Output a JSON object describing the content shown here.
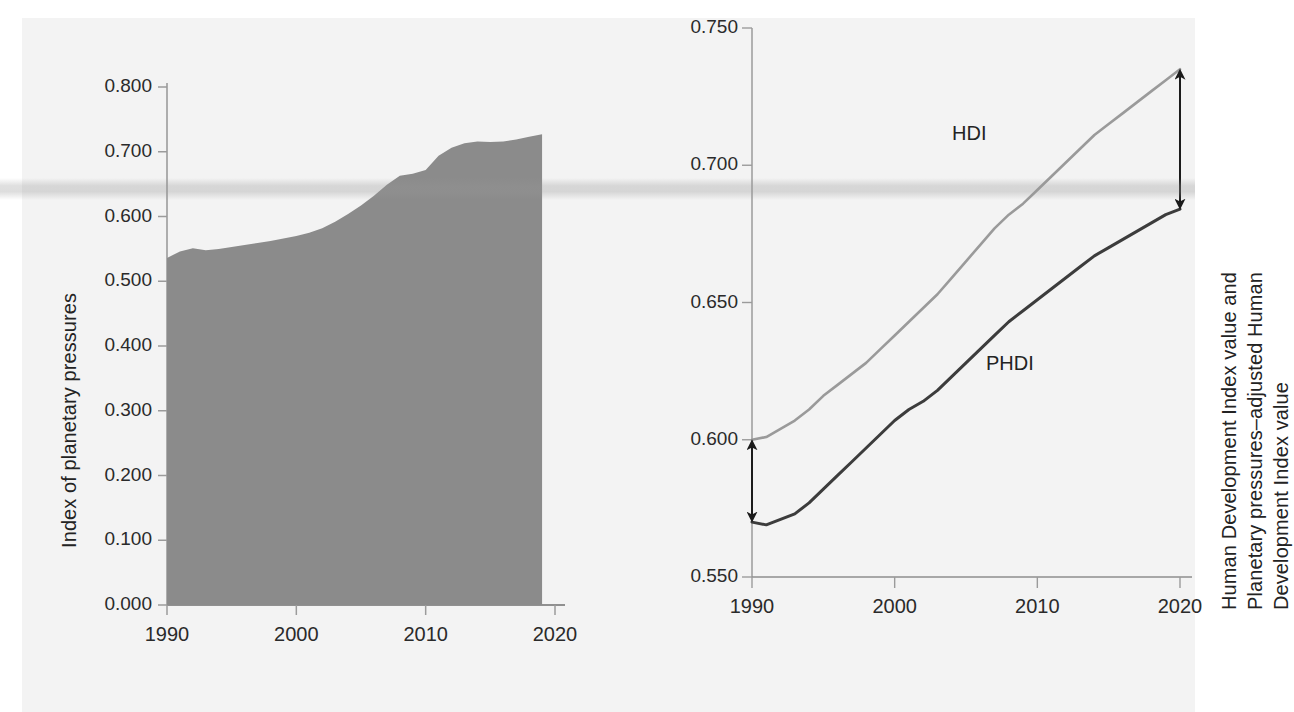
{
  "figure": {
    "background_color": "#f3f3f3",
    "page_color": "#ffffff"
  },
  "chart_data": [
    {
      "id": "planetary-pressures",
      "type": "area",
      "title": "",
      "xlabel": "",
      "ylabel": "Index of planetary pressures",
      "xlim": [
        1990,
        2020
      ],
      "ylim": [
        0.0,
        0.8
      ],
      "grid": false,
      "legend": "none",
      "xticks": [
        "1990",
        "2000",
        "2010",
        "2020"
      ],
      "xtick_values": [
        1990,
        2000,
        2010,
        2020
      ],
      "yticks": [
        "0.000",
        "0.100",
        "0.200",
        "0.300",
        "0.400",
        "0.500",
        "0.600",
        "0.700",
        "0.800"
      ],
      "ytick_values": [
        0.0,
        0.1,
        0.2,
        0.3,
        0.4,
        0.5,
        0.6,
        0.7,
        0.8
      ],
      "area_color": "#8b8b8b",
      "series": [
        {
          "name": "Index of planetary pressures",
          "x": [
            1990,
            1991,
            1992,
            1993,
            1994,
            1995,
            1996,
            1997,
            1998,
            1999,
            2000,
            2001,
            2002,
            2003,
            2004,
            2005,
            2006,
            2007,
            2008,
            2009,
            2010,
            2011,
            2012,
            2013,
            2014,
            2015,
            2016,
            2017,
            2018,
            2019
          ],
          "values": [
            0.536,
            0.546,
            0.551,
            0.548,
            0.55,
            0.553,
            0.556,
            0.559,
            0.562,
            0.566,
            0.57,
            0.575,
            0.582,
            0.592,
            0.604,
            0.617,
            0.632,
            0.649,
            0.663,
            0.666,
            0.672,
            0.694,
            0.706,
            0.713,
            0.716,
            0.715,
            0.716,
            0.719,
            0.723,
            0.727
          ]
        }
      ]
    },
    {
      "id": "hdi-phdi",
      "type": "line",
      "title": "",
      "xlabel": "",
      "ylabel": "Human Development Index value and\nPlanetary pressures–adjusted Human\nDevelopment Index value",
      "xlim": [
        1990,
        2020
      ],
      "ylim": [
        0.55,
        0.75
      ],
      "grid": false,
      "legend": "inline-labels",
      "xticks": [
        "1990",
        "2000",
        "2010",
        "2020"
      ],
      "xtick_values": [
        1990,
        2000,
        2010,
        2020
      ],
      "yticks": [
        "0.550",
        "0.600",
        "0.650",
        "0.700",
        "0.750"
      ],
      "ytick_values": [
        0.55,
        0.6,
        0.65,
        0.7,
        0.75
      ],
      "annotations": [
        {
          "name": "gap-arrow-1990",
          "year": 1990,
          "from": 0.6,
          "to": 0.57
        },
        {
          "name": "gap-arrow-2020",
          "year": 2020,
          "from": 0.735,
          "to": 0.684
        }
      ],
      "series": [
        {
          "name": "HDI",
          "label": "HDI",
          "color": "#9a9a9a",
          "x": [
            1990,
            1991,
            1992,
            1993,
            1994,
            1995,
            1996,
            1997,
            1998,
            1999,
            2000,
            2001,
            2002,
            2003,
            2004,
            2005,
            2006,
            2007,
            2008,
            2009,
            2010,
            2011,
            2012,
            2013,
            2014,
            2015,
            2016,
            2017,
            2018,
            2019,
            2020
          ],
          "values": [
            0.6,
            0.601,
            0.604,
            0.607,
            0.611,
            0.616,
            0.62,
            0.624,
            0.628,
            0.633,
            0.638,
            0.643,
            0.648,
            0.653,
            0.659,
            0.665,
            0.671,
            0.677,
            0.682,
            0.686,
            0.691,
            0.696,
            0.701,
            0.706,
            0.711,
            0.715,
            0.719,
            0.723,
            0.727,
            0.731,
            0.735
          ]
        },
        {
          "name": "PHDI",
          "label": "PHDI",
          "color": "#3c3c3c",
          "x": [
            1990,
            1991,
            1992,
            1993,
            1994,
            1995,
            1996,
            1997,
            1998,
            1999,
            2000,
            2001,
            2002,
            2003,
            2004,
            2005,
            2006,
            2007,
            2008,
            2009,
            2010,
            2011,
            2012,
            2013,
            2014,
            2015,
            2016,
            2017,
            2018,
            2019,
            2020
          ],
          "values": [
            0.57,
            0.569,
            0.571,
            0.573,
            0.577,
            0.582,
            0.587,
            0.592,
            0.597,
            0.602,
            0.607,
            0.611,
            0.614,
            0.618,
            0.623,
            0.628,
            0.633,
            0.638,
            0.643,
            0.647,
            0.651,
            0.655,
            0.659,
            0.663,
            0.667,
            0.67,
            0.673,
            0.676,
            0.679,
            0.682,
            0.684
          ]
        }
      ]
    }
  ]
}
